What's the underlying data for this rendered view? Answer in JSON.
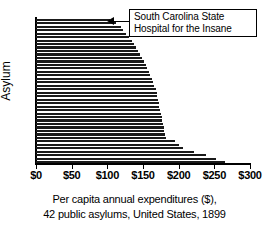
{
  "chart_data": {
    "type": "bar",
    "orientation": "horizontal",
    "title": "",
    "xlabel": "Per capita annual expenditures ($), 42 public asylums, United States, 1899",
    "ylabel": "Asylum",
    "xlim": [
      0,
      300
    ],
    "ylim": [
      0,
      42
    ],
    "grid": false,
    "legend": null,
    "xtick_labels": [
      "$0",
      "$50",
      "$100",
      "$150",
      "$200",
      "$250",
      "$300"
    ],
    "xtick_values": [
      0,
      50,
      100,
      150,
      200,
      250,
      300
    ],
    "categories": [
      "Asylum 1",
      "Asylum 2",
      "Asylum 3",
      "Asylum 4",
      "Asylum 5",
      "Asylum 6",
      "Asylum 7",
      "Asylum 8",
      "Asylum 9",
      "Asylum 10",
      "Asylum 11",
      "Asylum 12",
      "Asylum 13",
      "Asylum 14",
      "Asylum 15",
      "Asylum 16",
      "Asylum 17",
      "Asylum 18",
      "Asylum 19",
      "Asylum 20",
      "Asylum 21",
      "Asylum 22",
      "Asylum 23",
      "Asylum 24",
      "Asylum 25",
      "Asylum 26",
      "Asylum 27",
      "Asylum 28",
      "Asylum 29",
      "Asylum 30",
      "Asylum 31",
      "Asylum 32",
      "Asylum 33",
      "Asylum 34",
      "Asylum 35",
      "Asylum 36",
      "Asylum 37",
      "Asylum 38",
      "Asylum 39",
      "Asylum 40",
      "Asylum 41",
      "Asylum 42"
    ],
    "values": [
      104,
      112,
      119,
      122,
      126,
      131,
      134,
      137,
      140,
      143,
      146,
      149,
      152,
      154,
      156,
      158,
      160,
      162,
      164,
      166,
      168,
      169,
      170,
      171,
      172,
      173,
      174,
      175,
      176,
      177,
      178,
      179,
      180,
      181,
      182,
      195,
      200,
      206,
      222,
      238,
      252,
      265
    ],
    "bar_color": "#1a1a1a",
    "background_color": "#ffffff"
  },
  "annotation": {
    "line1": "South Carolina State",
    "line2": "Hospital for the Insane",
    "points_to_index": 0
  },
  "caption": {
    "line1": "Per capita annual expenditures ($),",
    "line2": "42 public asylums, United States, 1899"
  },
  "axis": {
    "ylabel": "Asylum"
  }
}
